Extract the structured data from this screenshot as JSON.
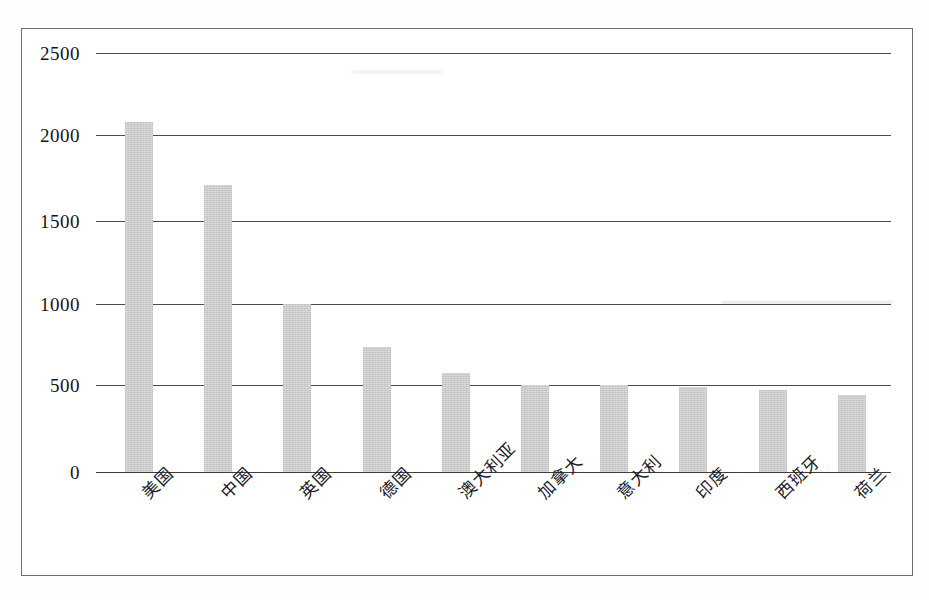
{
  "document": {
    "kind": "scanned-chart-page",
    "background_color": "#ffffff",
    "border_color": "#6e6e72"
  },
  "chart_data": {
    "type": "bar",
    "title": "",
    "subtitle": "",
    "xlabel": "",
    "ylabel": "",
    "categories": [
      "美国",
      "中国",
      "英国",
      "德国",
      "澳大利亚",
      "加拿大",
      "意大利",
      "印度",
      "西班牙",
      "荷兰"
    ],
    "values": [
      2090,
      1715,
      1000,
      745,
      590,
      520,
      520,
      510,
      490,
      460
    ],
    "series": [
      {
        "name": "",
        "values": [
          2090,
          1715,
          1000,
          745,
          590,
          520,
          520,
          510,
          490,
          460
        ]
      }
    ],
    "ylim": [
      0,
      2500
    ],
    "yticks": [
      0,
      500,
      1000,
      1500,
      2000,
      2500
    ],
    "ytick_labels": [
      "0",
      "500",
      "1000",
      "1500",
      "2000",
      "2500"
    ],
    "grid": true,
    "grid_axis": "y",
    "legend": false,
    "legend_position": "none",
    "bar_color": "#c9c9c9",
    "bar_edge_color": "#c9c9c9",
    "gridline_color": "#4b4b50",
    "xtick_rotation": -45,
    "annotations": []
  },
  "axis": {
    "y": {
      "ticks": [
        {
          "label": "2500",
          "value": 2500
        },
        {
          "label": "2000",
          "value": 2000
        },
        {
          "label": "1500",
          "value": 1500
        },
        {
          "label": "1000",
          "value": 1000
        },
        {
          "label": "500",
          "value": 500
        },
        {
          "label": "0",
          "value": 0
        }
      ]
    },
    "x": {
      "ticks": [
        {
          "label": "美国"
        },
        {
          "label": "中国"
        },
        {
          "label": "英国"
        },
        {
          "label": "德国"
        },
        {
          "label": "澳大利亚"
        },
        {
          "label": "加拿大"
        },
        {
          "label": "意大利"
        },
        {
          "label": "印度"
        },
        {
          "label": "西班牙"
        },
        {
          "label": "荷兰"
        }
      ]
    }
  }
}
